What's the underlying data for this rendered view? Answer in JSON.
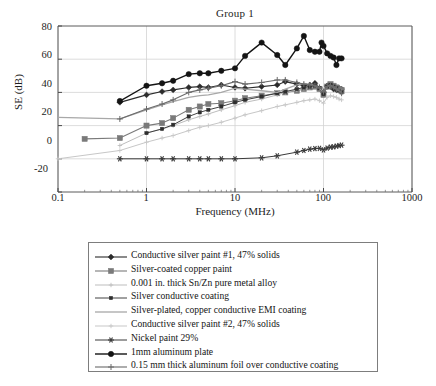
{
  "chart_data": {
    "type": "line",
    "title": "Group 1",
    "xlabel": "Frequency (MHz)",
    "ylabel": "SE (dB)",
    "xscale": "log",
    "xlim": [
      0.1,
      1000
    ],
    "ylim": [
      -20,
      80
    ],
    "xticks": [
      "0.1",
      "1",
      "10",
      "100",
      "1000"
    ],
    "yticks": [
      "-20",
      "0",
      "20",
      "40",
      "60",
      "80"
    ],
    "grid": true,
    "legend_position": "below-plot",
    "series": [
      {
        "name": "Conductive silver paint  #1, 47% solids",
        "color": "#2b2b2b",
        "marker": "diamond",
        "linewidth": 1.1,
        "x": [
          0.5,
          1,
          1.5,
          2,
          3,
          4,
          5,
          7,
          10,
          13,
          20,
          30,
          37,
          50,
          60,
          70,
          80,
          90,
          100,
          110,
          120,
          130,
          140,
          150,
          160
        ],
        "y": [
          34.0,
          38.5,
          40.5,
          41.5,
          43.0,
          43.5,
          43.0,
          44.5,
          43.0,
          42.5,
          43.5,
          44.5,
          46.5,
          45.0,
          44.0,
          44.5,
          45.5,
          42.5,
          40.0,
          44.0,
          43.5,
          42.0,
          41.5,
          42.5,
          42.0
        ]
      },
      {
        "name": "Silver-coated copper paint",
        "color": "#7a7a7a",
        "marker": "square",
        "linewidth": 1.1,
        "x": [
          0.2,
          0.5,
          1,
          1.5,
          2,
          3,
          4,
          5,
          7,
          10,
          13,
          20,
          30,
          37,
          50,
          60,
          70,
          80,
          90,
          100,
          110,
          120,
          130,
          140,
          150,
          160
        ],
        "y": [
          12.0,
          12.5,
          20.0,
          21.5,
          24.5,
          29.5,
          31.5,
          33.0,
          33.5,
          35.0,
          36.5,
          38.0,
          39.5,
          40.0,
          41.0,
          42.0,
          43.0,
          43.5,
          42.0,
          38.5,
          43.5,
          45.0,
          44.0,
          43.0,
          42.0,
          41.5
        ]
      },
      {
        "name": "0.001 in. thick Sn/Zn pure metal alloy",
        "color": "#bdbdbd",
        "marker": "plus-small",
        "linewidth": 1.0,
        "x": [
          0.5,
          1,
          1.5,
          2,
          3,
          4,
          5,
          7,
          10,
          13,
          20,
          30,
          37,
          50,
          60,
          70,
          80,
          90,
          100,
          110,
          120,
          130,
          140,
          150,
          160
        ],
        "y": [
          8.0,
          15.5,
          18.0,
          20.0,
          23.5,
          25.5,
          27.0,
          29.5,
          32.0,
          34.0,
          36.0,
          38.5,
          40.0,
          41.5,
          42.5,
          43.0,
          43.5,
          42.5,
          40.0,
          43.0,
          44.0,
          43.5,
          42.5,
          41.5,
          40.5
        ]
      },
      {
        "name": "Silver conductive coating",
        "color": "#2e2e2e",
        "marker": "square-small",
        "linewidth": 0.9,
        "x": [
          1,
          1.5,
          2,
          3,
          4,
          5,
          7,
          10,
          13,
          20,
          30,
          37,
          50,
          60,
          70,
          80,
          90,
          100,
          110,
          120,
          130,
          140,
          150,
          160
        ],
        "y": [
          15.5,
          18.0,
          20.5,
          25.5,
          28.0,
          29.5,
          31.5,
          34.0,
          35.5,
          37.5,
          39.5,
          40.5,
          42.0,
          43.0,
          43.5,
          44.0,
          42.5,
          39.0,
          43.5,
          44.5,
          43.5,
          42.5,
          41.0,
          40.0
        ]
      },
      {
        "name": "Silver-plated, copper conductive EMI coating",
        "color": "#a8a8a8",
        "marker": "none",
        "linewidth": 1.3,
        "x": [
          0.1,
          0.5,
          1,
          1.5,
          2,
          3,
          4,
          5,
          7,
          10,
          13,
          20,
          30,
          37,
          50,
          60,
          70,
          80,
          90,
          100,
          110,
          120,
          130,
          140,
          150,
          160
        ],
        "y": [
          25.0,
          24.0,
          29.5,
          32.5,
          34.5,
          37.0,
          38.0,
          38.5,
          40.0,
          42.5,
          42.0,
          41.0,
          40.0,
          42.0,
          44.5,
          45.5,
          45.0,
          44.0,
          42.5,
          40.0,
          43.5,
          44.5,
          43.0,
          42.0,
          41.0,
          40.0
        ]
      },
      {
        "name": "Conductive silver paint #2, 47% solids",
        "color": "#c7c7c7",
        "marker": "plus-small",
        "linewidth": 1.0,
        "x": [
          0.1,
          0.5,
          1,
          1.5,
          2,
          3,
          4,
          5,
          7,
          10,
          13,
          20,
          30,
          37,
          50,
          60,
          70,
          80,
          90,
          100,
          110,
          120,
          130,
          140,
          150,
          160
        ],
        "y": [
          0.0,
          5.0,
          10.0,
          12.5,
          14.0,
          17.0,
          19.0,
          20.0,
          22.0,
          24.5,
          26.5,
          29.0,
          31.5,
          32.5,
          34.0,
          35.0,
          35.5,
          36.0,
          35.0,
          33.5,
          37.0,
          38.0,
          37.5,
          37.0,
          36.0,
          35.5
        ]
      },
      {
        "name": "Nickel paint 29%",
        "color": "#3a3a3a",
        "marker": "asterisk",
        "linewidth": 1.0,
        "x": [
          0.5,
          1,
          1.5,
          2,
          3,
          4,
          5,
          7,
          10,
          20,
          30,
          50,
          60,
          70,
          80,
          90,
          100,
          110,
          120,
          130,
          140,
          150,
          160
        ],
        "y": [
          0.0,
          0.0,
          0.0,
          0.0,
          0.0,
          0.0,
          0.0,
          0.0,
          0.0,
          0.6,
          1.8,
          4.0,
          5.0,
          5.8,
          6.2,
          6.3,
          5.4,
          6.5,
          7.0,
          7.2,
          7.6,
          8.0,
          8.2
        ]
      },
      {
        "name": "1mm aluminum plate",
        "color": "#141414",
        "marker": "circle",
        "linewidth": 1.4,
        "x": [
          0.5,
          1,
          1.5,
          2,
          3,
          4,
          5,
          7,
          10,
          13,
          20,
          30,
          37,
          50,
          60,
          70,
          80,
          90,
          95,
          100,
          110,
          120,
          130,
          140,
          150,
          160
        ],
        "y": [
          34.8,
          44.0,
          45.5,
          47.0,
          51.0,
          51.5,
          51.5,
          53.0,
          54.5,
          62.0,
          70.0,
          62.5,
          56.5,
          66.5,
          74.0,
          65.5,
          64.5,
          64.5,
          70.0,
          68.0,
          63.5,
          62.0,
          61.0,
          56.5,
          60.5,
          60.5
        ]
      },
      {
        "name": "0.15 mm thick aluminum foil over conductive coating",
        "color": "#6b6b6b",
        "marker": "plus",
        "linewidth": 1.1,
        "x": [
          0.5,
          1,
          1.5,
          2,
          3,
          4,
          5,
          7,
          10,
          13,
          20,
          30,
          37,
          50,
          60,
          70,
          80,
          90,
          100,
          110,
          120,
          130,
          140,
          150,
          160
        ],
        "y": [
          24.0,
          30.0,
          33.0,
          35.5,
          40.0,
          41.5,
          42.5,
          44.0,
          46.5,
          45.0,
          46.0,
          47.5,
          47.5,
          46.0,
          45.0,
          44.5,
          44.0,
          43.0,
          40.5,
          43.5,
          44.0,
          43.5,
          42.5,
          41.5,
          39.5
        ]
      }
    ]
  },
  "legend": {
    "entries": [
      "Conductive silver paint  #1, 47% solids",
      "Silver-coated copper paint",
      "0.001 in. thick Sn/Zn pure metal alloy",
      "Silver conductive coating",
      "Silver-plated, copper conductive EMI coating",
      "Conductive silver paint #2, 47% solids",
      "Nickel paint 29%",
      "1mm aluminum plate",
      "0.15 mm thick aluminum foil over conductive coating"
    ]
  }
}
